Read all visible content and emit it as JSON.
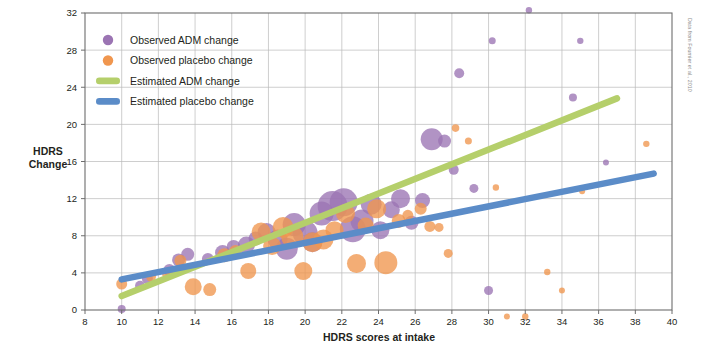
{
  "figure": {
    "source_note": "Data from Fournier et al., 2010",
    "background": "#ffffff"
  },
  "colors": {
    "adm_purple": "#9b74b3",
    "placebo_orange": "#f0964e",
    "estimated_adm_green": "#b5cf6b",
    "estimated_placebo_blue": "#5b8cc8",
    "grid": "#b9b9b9",
    "frame": "#6d6d6d",
    "text": "#231f20"
  },
  "legend": {
    "position": "top-left-inside",
    "items": [
      {
        "label": "Observed ADM change",
        "marker": "circle",
        "color": "#9b74b3",
        "name": "legend-observed-adm"
      },
      {
        "label": "Observed placebo change",
        "marker": "circle",
        "color": "#f0964e",
        "name": "legend-observed-placebo"
      },
      {
        "label": "Estimated ADM change",
        "marker": "line",
        "color": "#b5cf6b",
        "name": "legend-estimated-adm"
      },
      {
        "label": "Estimated placebo change",
        "marker": "line",
        "color": "#5b8cc8",
        "name": "legend-estimated-placebo"
      }
    ]
  },
  "chart_data": {
    "type": "scatter",
    "title": "",
    "subtitle": "",
    "xlabel": "HDRS scores at intake",
    "ylabel": "HDRS Change",
    "ylabel_lines": [
      "HDRS",
      "Change"
    ],
    "xlim": [
      8,
      40
    ],
    "ylim": [
      0,
      32
    ],
    "xticks": [
      8,
      10,
      12,
      14,
      16,
      18,
      20,
      22,
      24,
      26,
      28,
      30,
      32,
      34,
      36,
      38,
      40
    ],
    "yticks": [
      0,
      4,
      8,
      12,
      16,
      20,
      24,
      28,
      32
    ],
    "xtick_labels": [
      "8",
      "10",
      "12",
      "14",
      "16",
      "18",
      "20",
      "22",
      "24",
      "26",
      "28",
      "30",
      "32",
      "34",
      "36",
      "38",
      "40"
    ],
    "ytick_labels": [
      "0",
      "4",
      "8",
      "12",
      "16",
      "20",
      "24",
      "28",
      "32"
    ],
    "grid": true,
    "legend_position": "upper left",
    "annotations": [
      "Data from Fournier et al., 2010"
    ],
    "note": "Bubble area encodes study sample size; r = bubble radius in data-pixel units.",
    "series": [
      {
        "name": "Observed ADM change",
        "type": "bubble",
        "color": "#9b74b3",
        "points": [
          {
            "x": 10.0,
            "y": 0.1,
            "r": 4.0
          },
          {
            "x": 11.0,
            "y": 2.6,
            "r": 5.0
          },
          {
            "x": 11.4,
            "y": 3.4,
            "r": 5.5
          },
          {
            "x": 12.6,
            "y": 4.3,
            "r": 6.0
          },
          {
            "x": 13.1,
            "y": 5.4,
            "r": 6.5
          },
          {
            "x": 13.6,
            "y": 6.0,
            "r": 6.5
          },
          {
            "x": 14.7,
            "y": 5.5,
            "r": 6.0
          },
          {
            "x": 15.5,
            "y": 6.2,
            "r": 7.5
          },
          {
            "x": 16.1,
            "y": 6.8,
            "r": 7.0
          },
          {
            "x": 16.8,
            "y": 7.0,
            "r": 8.5
          },
          {
            "x": 17.3,
            "y": 7.7,
            "r": 7.0
          },
          {
            "x": 17.9,
            "y": 8.4,
            "r": 9.0
          },
          {
            "x": 18.5,
            "y": 7.6,
            "r": 10.0
          },
          {
            "x": 19.0,
            "y": 6.6,
            "r": 11.0
          },
          {
            "x": 19.4,
            "y": 9.2,
            "r": 11.5
          },
          {
            "x": 20.0,
            "y": 8.3,
            "r": 12.5
          },
          {
            "x": 20.4,
            "y": 7.3,
            "r": 10.0
          },
          {
            "x": 20.9,
            "y": 10.4,
            "r": 12.0
          },
          {
            "x": 21.5,
            "y": 11.2,
            "r": 15.0
          },
          {
            "x": 22.1,
            "y": 11.6,
            "r": 14.0
          },
          {
            "x": 22.6,
            "y": 8.7,
            "r": 13.0
          },
          {
            "x": 23.1,
            "y": 9.6,
            "r": 11.5
          },
          {
            "x": 23.6,
            "y": 11.4,
            "r": 10.5
          },
          {
            "x": 24.1,
            "y": 8.6,
            "r": 9.0
          },
          {
            "x": 24.7,
            "y": 10.8,
            "r": 8.5
          },
          {
            "x": 25.2,
            "y": 12.0,
            "r": 9.5
          },
          {
            "x": 25.8,
            "y": 9.4,
            "r": 7.0
          },
          {
            "x": 26.4,
            "y": 11.8,
            "r": 7.5
          },
          {
            "x": 26.9,
            "y": 18.4,
            "r": 11.0
          },
          {
            "x": 27.6,
            "y": 18.2,
            "r": 6.5
          },
          {
            "x": 28.1,
            "y": 15.1,
            "r": 5.0
          },
          {
            "x": 28.4,
            "y": 25.5,
            "r": 5.0
          },
          {
            "x": 29.2,
            "y": 13.1,
            "r": 4.5
          },
          {
            "x": 30.0,
            "y": 2.1,
            "r": 4.5
          },
          {
            "x": 30.2,
            "y": 29.0,
            "r": 3.5
          },
          {
            "x": 32.2,
            "y": 32.3,
            "r": 3.2
          },
          {
            "x": 34.6,
            "y": 22.9,
            "r": 4.0
          },
          {
            "x": 35.0,
            "y": 29.0,
            "r": 3.2
          },
          {
            "x": 36.4,
            "y": 15.9,
            "r": 3.0
          }
        ]
      },
      {
        "name": "Observed placebo change",
        "type": "bubble",
        "color": "#f0964e",
        "points": [
          {
            "x": 10.0,
            "y": 2.8,
            "r": 5.5
          },
          {
            "x": 11.6,
            "y": 3.6,
            "r": 5.0
          },
          {
            "x": 12.5,
            "y": 3.9,
            "r": 5.5
          },
          {
            "x": 13.2,
            "y": 5.3,
            "r": 6.0
          },
          {
            "x": 13.9,
            "y": 2.5,
            "r": 8.5
          },
          {
            "x": 14.8,
            "y": 2.2,
            "r": 6.5
          },
          {
            "x": 15.6,
            "y": 5.9,
            "r": 7.0
          },
          {
            "x": 16.2,
            "y": 6.3,
            "r": 6.5
          },
          {
            "x": 16.9,
            "y": 4.2,
            "r": 8.0
          },
          {
            "x": 17.6,
            "y": 8.4,
            "r": 9.5
          },
          {
            "x": 18.2,
            "y": 6.9,
            "r": 9.0
          },
          {
            "x": 18.8,
            "y": 8.9,
            "r": 10.5
          },
          {
            "x": 19.3,
            "y": 7.9,
            "r": 11.0
          },
          {
            "x": 19.9,
            "y": 4.2,
            "r": 9.0
          },
          {
            "x": 20.4,
            "y": 7.3,
            "r": 10.0
          },
          {
            "x": 21.0,
            "y": 7.6,
            "r": 10.0
          },
          {
            "x": 21.6,
            "y": 8.6,
            "r": 9.0
          },
          {
            "x": 22.2,
            "y": 10.4,
            "r": 9.5
          },
          {
            "x": 22.8,
            "y": 5.0,
            "r": 9.5
          },
          {
            "x": 23.3,
            "y": 9.1,
            "r": 8.0
          },
          {
            "x": 23.9,
            "y": 10.9,
            "r": 9.5
          },
          {
            "x": 24.4,
            "y": 5.1,
            "r": 11.5
          },
          {
            "x": 25.1,
            "y": 9.6,
            "r": 7.0
          },
          {
            "x": 25.6,
            "y": 10.2,
            "r": 5.5
          },
          {
            "x": 26.3,
            "y": 10.9,
            "r": 6.0
          },
          {
            "x": 26.8,
            "y": 9.0,
            "r": 5.5
          },
          {
            "x": 27.3,
            "y": 8.9,
            "r": 4.5
          },
          {
            "x": 27.8,
            "y": 6.1,
            "r": 4.5
          },
          {
            "x": 28.2,
            "y": 19.6,
            "r": 3.8
          },
          {
            "x": 28.9,
            "y": 18.2,
            "r": 3.5
          },
          {
            "x": 30.4,
            "y": 13.2,
            "r": 3.2
          },
          {
            "x": 31.0,
            "y": -0.7,
            "r": 3.0
          },
          {
            "x": 32.0,
            "y": -0.7,
            "r": 3.2
          },
          {
            "x": 33.2,
            "y": 4.1,
            "r": 3.2
          },
          {
            "x": 34.0,
            "y": 2.1,
            "r": 3.0
          },
          {
            "x": 35.1,
            "y": 12.8,
            "r": 3.0
          },
          {
            "x": 38.6,
            "y": 17.9,
            "r": 3.2
          }
        ]
      },
      {
        "name": "Estimated ADM change",
        "type": "line",
        "color": "#b5cf6b",
        "x": [
          10,
          37
        ],
        "y": [
          1.5,
          22.8
        ]
      },
      {
        "name": "Estimated placebo change",
        "type": "line",
        "color": "#5b8cc8",
        "x": [
          10,
          39
        ],
        "y": [
          3.3,
          14.7
        ]
      }
    ]
  }
}
